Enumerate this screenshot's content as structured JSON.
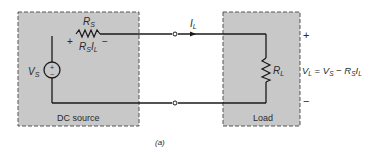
{
  "diagram": {
    "caption": "(a)",
    "source_box": {
      "label": "DC source",
      "fill": "#c8c8c8"
    },
    "load_box": {
      "label": "Load",
      "fill": "#c8c8c8"
    },
    "components": {
      "source_voltage": {
        "symbol": "V",
        "subscript": "S",
        "polarity_plus": "+",
        "polarity_minus": "−"
      },
      "source_resistor": {
        "symbol": "R",
        "subscript": "S",
        "plus_sign": "+",
        "minus_sign": "−"
      },
      "resistor_drop": {
        "symbol": "R",
        "subscript": "S",
        "current": "I",
        "current_sub": "L"
      },
      "load_current": {
        "symbol": "I",
        "subscript": "L"
      },
      "load_resistor": {
        "symbol": "R",
        "subscript": "L"
      }
    },
    "output": {
      "plus": "+",
      "minus": "−",
      "equation": {
        "lhs": "V",
        "lhs_sub": "L",
        "eq": " = ",
        "t1": "V",
        "t1_sub": "S",
        "op": " − ",
        "t2": "R",
        "t2_sub": "S",
        "t3": "I",
        "t3_sub": "L"
      }
    },
    "colors": {
      "line": "#1a1a1a",
      "box_border": "#555555"
    }
  }
}
